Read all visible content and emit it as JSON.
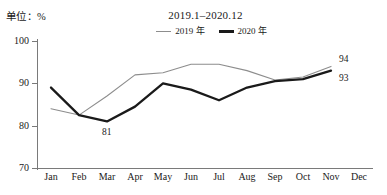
{
  "chart_data": {
    "type": "line",
    "title": "2019.1–2020.12",
    "unit_label": "单位：%",
    "xlabel": "",
    "ylabel": "",
    "ylim": [
      70,
      100
    ],
    "yticks": [
      70,
      80,
      90,
      100
    ],
    "grid": false,
    "legend_position": "top-center",
    "categories": [
      "Jan",
      "Feb",
      "Mar",
      "Apr",
      "May",
      "Jun",
      "Jul",
      "Aug",
      "Sep",
      "Oct",
      "Nov",
      "Dec"
    ],
    "series": [
      {
        "name": "2019 年",
        "color": "#8d8d8d",
        "width": 1.1,
        "values": [
          84.0,
          82.5,
          87.0,
          92.0,
          92.5,
          94.5,
          94.5,
          93.0,
          90.8,
          91.5,
          94.0,
          null
        ],
        "end_label": "94"
      },
      {
        "name": "2020 年",
        "color": "#1a1a1a",
        "width": 2.3,
        "values": [
          89.0,
          82.5,
          81.0,
          84.5,
          90.0,
          88.5,
          86.0,
          89.0,
          90.5,
          91.0,
          93.0,
          null
        ],
        "end_label": "93"
      }
    ],
    "annotations": [
      {
        "text": "81",
        "series": "2020 年",
        "category": "Mar",
        "value": 81
      },
      {
        "text": "94",
        "series": "2019 年",
        "category": "Nov",
        "value": 94
      },
      {
        "text": "93",
        "series": "2020 年",
        "category": "Nov",
        "value": 93
      }
    ]
  },
  "caption": ""
}
